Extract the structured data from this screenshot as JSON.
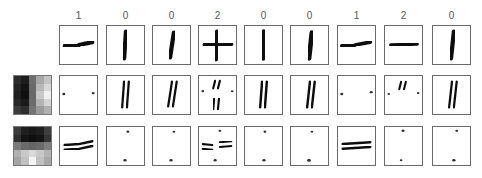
{
  "figure": {
    "column_labels": [
      "1",
      "0",
      "0",
      "2",
      "0",
      "0",
      "1",
      "2",
      "0"
    ],
    "column_x": [
      59,
      106,
      152,
      198,
      244,
      290,
      337,
      384,
      432
    ],
    "row_y": [
      25,
      75,
      126
    ],
    "rows": [
      {
        "name": "input-images",
        "kernel": null
      },
      {
        "name": "vertical-edge-filter-response",
        "kernel": "vertical-edge-kernel"
      },
      {
        "name": "horizontal-edge-filter-response",
        "kernel": "horizontal-edge-kernel"
      }
    ],
    "kernels": {
      "vertical": [
        [
          "#2a2a2a",
          "#1c1c1c",
          "#6e6e6e",
          "#a8a8a8",
          "#c4c4c4"
        ],
        [
          "#222222",
          "#141414",
          "#6a6a6a",
          "#b8b8b8",
          "#d8d8d8"
        ],
        [
          "#1e1e1e",
          "#101010",
          "#686868",
          "#c8c8c8",
          "#f0f0f0"
        ],
        [
          "#262626",
          "#1a1a1a",
          "#6c6c6c",
          "#b4b4b4",
          "#d4d4d4"
        ],
        [
          "#3a3a3a",
          "#2e2e2e",
          "#747474",
          "#9a9a9a",
          "#b0b0b0"
        ]
      ],
      "horizontal": [
        [
          "#3a3a3a",
          "#1e1e1e",
          "#181818",
          "#1e1e1e",
          "#3e3e3e"
        ],
        [
          "#2e2e2e",
          "#141414",
          "#0e0e0e",
          "#141414",
          "#343434"
        ],
        [
          "#7a7a7a",
          "#6a6a6a",
          "#646464",
          "#6a6a6a",
          "#7e7e7e"
        ],
        [
          "#b0b0b0",
          "#c8c8c8",
          "#d8d8d8",
          "#c8c8c8",
          "#b4b4b4"
        ],
        [
          "#a4a4a4",
          "#c0c0c0",
          "#f4f4f4",
          "#c0c0c0",
          "#a8a8a8"
        ]
      ]
    },
    "stroke_types": [
      "horizontal",
      "vertical",
      "vertical",
      "cross",
      "vertical",
      "vertical",
      "horizontal",
      "cross",
      "vertical"
    ]
  }
}
